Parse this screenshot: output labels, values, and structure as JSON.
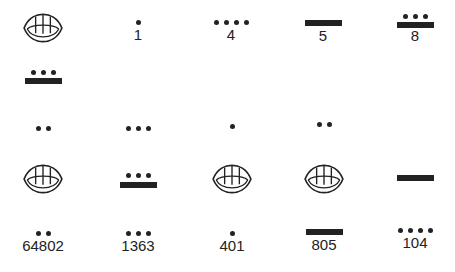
{
  "glyph_legend": {
    "shell": "zero (shell glyph)",
    "dot": "one",
    "bar": "five"
  },
  "row1": [
    {
      "glyph": "shell",
      "label": ""
    },
    {
      "glyph": "dots",
      "dots": 1,
      "label": "1"
    },
    {
      "glyph": "dots",
      "dots": 4,
      "label": "4"
    },
    {
      "glyph": "bar",
      "bars": 1,
      "label": "5"
    },
    {
      "glyph": "bar+dots",
      "bars": 1,
      "dots": 3,
      "label": "8"
    }
  ],
  "numbers": [
    {
      "value": "64802",
      "levels": [
        "8",
        "0",
        "2"
      ],
      "top_to_bottom": [
        "bar+3dots",
        "2dots",
        "shell",
        "2dots"
      ]
    },
    {
      "value": "1363",
      "levels": [
        "3",
        "8",
        "3"
      ],
      "top_to_bottom": [
        "3dots",
        "bar+3dots",
        "3dots"
      ]
    },
    {
      "value": "401",
      "levels": [
        "1",
        "0",
        "1"
      ],
      "top_to_bottom": [
        "1dot",
        "shell",
        "1dot"
      ]
    },
    {
      "value": "805",
      "levels": [
        "2",
        "0",
        "5"
      ],
      "top_to_bottom": [
        "2dots",
        "shell",
        "bar"
      ]
    },
    {
      "value": "104",
      "levels": [
        "5",
        "4"
      ],
      "top_to_bottom": [
        "bar",
        "4dots"
      ]
    }
  ],
  "labels": {
    "one": "1",
    "four": "4",
    "five": "5",
    "eight": "8",
    "n1": "64802",
    "n2": "1363",
    "n3": "401",
    "n4": "805",
    "n5": "104"
  }
}
